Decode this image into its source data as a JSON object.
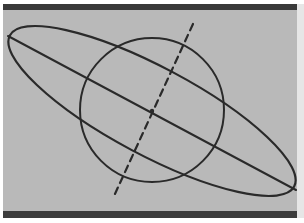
{
  "figure": {
    "colors": {
      "background": "#b9b9b9",
      "ink": "#2a2a2a",
      "band": "#3a3a3a",
      "margin": "#e6e6e6"
    },
    "center": {
      "x": 152,
      "y": 111
    },
    "circle": {
      "cx": 152,
      "cy": 110,
      "r": 72
    },
    "ellipse": {
      "cx": 152,
      "cy": 111,
      "rx": 161,
      "ry": 44,
      "rotation_deg": 28
    },
    "major_axis_line": {
      "x1": 8,
      "y1": 36,
      "x2": 296,
      "y2": 190
    },
    "dashed_line": {
      "x1": 193,
      "y1": 24,
      "x2": 114,
      "y2": 196,
      "dash": "7 5"
    }
  }
}
